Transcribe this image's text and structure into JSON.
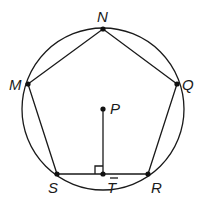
{
  "diagram": {
    "circle": {
      "center": "P",
      "cx": 103,
      "cy": 109,
      "r": 81
    },
    "points": [
      {
        "name": "N",
        "x": 103,
        "y": 29,
        "label": "N",
        "lx": 97,
        "ly": 22
      },
      {
        "name": "M",
        "x": 28,
        "y": 84,
        "label": "M",
        "lx": 10,
        "ly": 90
      },
      {
        "name": "Q",
        "x": 177,
        "y": 84,
        "label": "Q",
        "lx": 182,
        "ly": 90
      },
      {
        "name": "P",
        "x": 103,
        "y": 109,
        "label": "P",
        "lx": 110,
        "ly": 114
      },
      {
        "name": "S",
        "x": 57,
        "y": 174,
        "label": "S",
        "lx": 48,
        "ly": 193
      },
      {
        "name": "T",
        "x": 103,
        "y": 174,
        "label": "T",
        "lx": 107,
        "ly": 193
      },
      {
        "name": "R",
        "x": 148,
        "y": 174,
        "label": "R",
        "lx": 151,
        "ly": 193
      }
    ],
    "segments": [
      [
        "M",
        "N"
      ],
      [
        "N",
        "Q"
      ],
      [
        "Q",
        "R"
      ],
      [
        "R",
        "S"
      ],
      [
        "S",
        "M"
      ],
      [
        "P",
        "T"
      ]
    ],
    "right_angle_at": "T",
    "labels": {
      "N": "N",
      "M": "M",
      "Q": "Q",
      "P": "P",
      "S": "S",
      "T": "T",
      "R": "R"
    }
  }
}
